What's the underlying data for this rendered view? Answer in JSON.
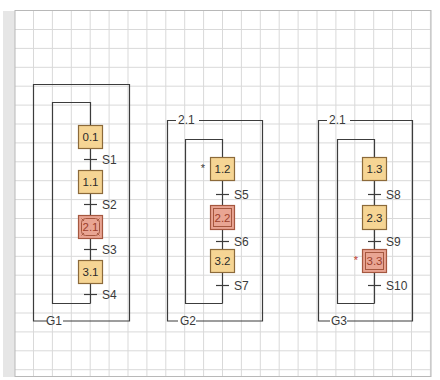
{
  "colors": {
    "grid": "#d9d9d9",
    "frame": "#b8b8b8",
    "line": "#3c3c3c",
    "step_fill": "#f6d594",
    "step_border": "#8c6a3a",
    "step_text": "#2a2a2a",
    "macro_fill": "#e9a593",
    "macro_border": "#a5573f",
    "macro_text": "#9c3f2c",
    "active_mark": "#c0392b"
  },
  "groups": [
    {
      "id": "G1",
      "label": "G1",
      "header_label": "",
      "steps": [
        {
          "label": "0.1",
          "type": "step",
          "mark": ""
        },
        {
          "label": "1.1",
          "type": "step",
          "mark": ""
        },
        {
          "label": "2.1",
          "type": "macro",
          "mark": ""
        },
        {
          "label": "3.1",
          "type": "step",
          "mark": ""
        }
      ],
      "transitions": [
        "S1",
        "S2",
        "S3",
        "S4"
      ]
    },
    {
      "id": "G2",
      "label": "G2",
      "header_label": "2.1",
      "steps": [
        {
          "label": "1.2",
          "type": "step",
          "mark": "*"
        },
        {
          "label": "2.2",
          "type": "enclosing",
          "mark": ""
        },
        {
          "label": "3.2",
          "type": "step",
          "mark": ""
        }
      ],
      "transitions": [
        "S5",
        "S6",
        "S7"
      ]
    },
    {
      "id": "G3",
      "label": "G3",
      "header_label": "2.1",
      "steps": [
        {
          "label": "1.3",
          "type": "step",
          "mark": ""
        },
        {
          "label": "2.3",
          "type": "step",
          "mark": ""
        },
        {
          "label": "3.3",
          "type": "enclosing",
          "mark": "*"
        }
      ],
      "transitions": [
        "S8",
        "S9",
        "S10"
      ]
    }
  ]
}
